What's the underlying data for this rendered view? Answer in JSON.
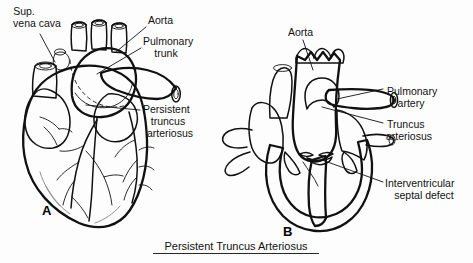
{
  "figure": {
    "caption": "Persistent Truncus Arteriosus",
    "background_color": "#fdfdfd",
    "ink_color": "#111111",
    "fill_gray": "#7f7f7f",
    "fill_dark_gray": "#565656",
    "fill_white": "#ffffff"
  },
  "panel_a": {
    "letter": "A",
    "labels": {
      "svc_line1": "Sup.",
      "svc_line2": "vena cava",
      "aorta": "Aorta",
      "pulmonary_line1": "Pulmonary",
      "pulmonary_line2": "trunk",
      "truncus_line1": "Persistent",
      "truncus_line2": "truncus",
      "truncus_line3": "arteriosus"
    }
  },
  "panel_b": {
    "letter": "B",
    "labels": {
      "aorta": "Aorta",
      "pulmonary_line1": "Pulmonary",
      "pulmonary_line2": "artery",
      "truncus_line1": "Truncus",
      "truncus_line2": "arteriosus",
      "vsd_line1": "Interventricular",
      "vsd_line2": "septal defect"
    }
  }
}
